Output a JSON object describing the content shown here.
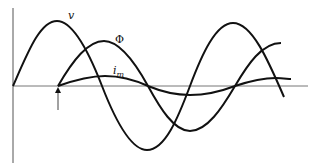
{
  "diagram": {
    "title": "",
    "labels": {
      "voltage": "v",
      "flux": "Φ",
      "magnetizing_current": "i",
      "magnetizing_current_sub": "m"
    },
    "colors": {
      "curve": "#111111",
      "axis": "#555555",
      "background": "#ffffff"
    },
    "annotations": {
      "arrow": "upward arrow marking switching instant at flux/current origin"
    }
  }
}
